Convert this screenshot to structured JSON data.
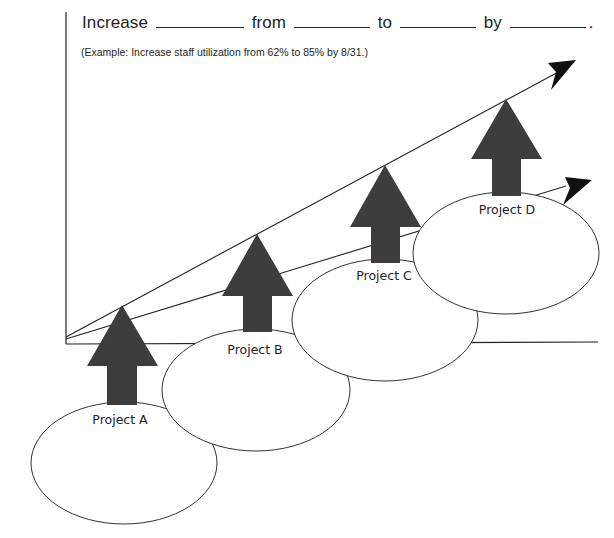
{
  "heading": {
    "word1": "Increase",
    "word2": "from",
    "word3": "to",
    "word4": "by",
    "end": "."
  },
  "example": "(Example: Increase staff utilization from 62% to 85% by 8/31.)",
  "projects": [
    {
      "label": "Project A"
    },
    {
      "label": "Project B"
    },
    {
      "label": "Project C"
    },
    {
      "label": "Project D"
    }
  ],
  "colors": {
    "arrow_fill": "#3d3d3d",
    "line": "#222222",
    "ellipse_stroke": "#333333"
  }
}
